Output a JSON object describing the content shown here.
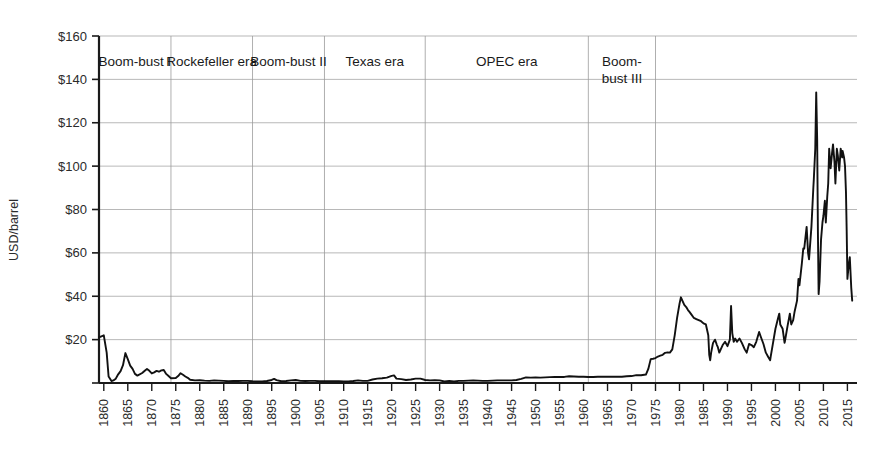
{
  "chart_data": {
    "type": "line",
    "title": "",
    "xlabel": "",
    "ylabel": "USD/barrel",
    "xlim": [
      1859,
      2017
    ],
    "ylim": [
      0,
      160
    ],
    "grid": true,
    "legend": "none",
    "y_ticks": [
      {
        "value": 160,
        "label": "$160"
      },
      {
        "value": 140,
        "label": "$140"
      },
      {
        "value": 120,
        "label": "$120"
      },
      {
        "value": 100,
        "label": "$100"
      },
      {
        "value": 80,
        "label": "$80"
      },
      {
        "value": 60,
        "label": "$60"
      },
      {
        "value": 40,
        "label": "$40"
      },
      {
        "value": 20,
        "label": "$20"
      }
    ],
    "x_ticks": [
      {
        "value": 1860,
        "label": "1860"
      },
      {
        "value": 1865,
        "label": "1865"
      },
      {
        "value": 1870,
        "label": "1870"
      },
      {
        "value": 1875,
        "label": "1875"
      },
      {
        "value": 1880,
        "label": "1880"
      },
      {
        "value": 1885,
        "label": "1885"
      },
      {
        "value": 1890,
        "label": "1890"
      },
      {
        "value": 1895,
        "label": "1895"
      },
      {
        "value": 1900,
        "label": "1900"
      },
      {
        "value": 1905,
        "label": "1905"
      },
      {
        "value": 1910,
        "label": "1910"
      },
      {
        "value": 1915,
        "label": "1915"
      },
      {
        "value": 1920,
        "label": "1920"
      },
      {
        "value": 1925,
        "label": "1925"
      },
      {
        "value": 1930,
        "label": "1930"
      },
      {
        "value": 1935,
        "label": "1935"
      },
      {
        "value": 1940,
        "label": "1940"
      },
      {
        "value": 1945,
        "label": "1945"
      },
      {
        "value": 1950,
        "label": "1950"
      },
      {
        "value": 1955,
        "label": "1955"
      },
      {
        "value": 1960,
        "label": "1960"
      },
      {
        "value": 1965,
        "label": "1965"
      },
      {
        "value": 1970,
        "label": "1970"
      },
      {
        "value": 1975,
        "label": "1975"
      },
      {
        "value": 1980,
        "label": "1980"
      },
      {
        "value": 1985,
        "label": "1985"
      },
      {
        "value": 1990,
        "label": "1990"
      },
      {
        "value": 1995,
        "label": "1995"
      },
      {
        "value": 2000,
        "label": "2000"
      },
      {
        "value": 2005,
        "label": "2005"
      },
      {
        "value": 2010,
        "label": "2010"
      },
      {
        "value": 2015,
        "label": "2015"
      }
    ],
    "eras": [
      {
        "label": "Boom-bust I",
        "start": 1859,
        "end": 1874
      },
      {
        "label": "Rockefeller era",
        "start": 1874,
        "end": 1891
      },
      {
        "label": "Boom-bust II",
        "start": 1891,
        "end": 1906
      },
      {
        "label": "Texas era",
        "start": 1906,
        "end": 1927
      },
      {
        "label": "OPEC era",
        "start": 1927,
        "end": 1961
      },
      {
        "label": "Boom-\nbust III",
        "start": 1961,
        "end": 1975
      }
    ],
    "era_boundaries_year": [
      1874,
      1891,
      1906,
      1927,
      1961,
      1975
    ],
    "series": [
      {
        "name": "Crude oil price (USD/barrel, nominal)",
        "color": "#111111",
        "points": [
          [
            1859,
            21.0
          ],
          [
            1860,
            22.0
          ],
          [
            1860.6,
            14.0
          ],
          [
            1861,
            3.0
          ],
          [
            1861.6,
            0.9
          ],
          [
            1862,
            1.2
          ],
          [
            1862.5,
            2.0
          ],
          [
            1863,
            4.0
          ],
          [
            1863.5,
            5.5
          ],
          [
            1864,
            8.2
          ],
          [
            1864.5,
            13.8
          ],
          [
            1865,
            11.0
          ],
          [
            1865.5,
            8.0
          ],
          [
            1866,
            6.5
          ],
          [
            1866.5,
            4.2
          ],
          [
            1867,
            3.4
          ],
          [
            1868,
            4.6
          ],
          [
            1868.6,
            5.8
          ],
          [
            1869,
            6.5
          ],
          [
            1869.5,
            5.6
          ],
          [
            1870,
            4.4
          ],
          [
            1870.5,
            4.9
          ],
          [
            1871,
            5.6
          ],
          [
            1871.5,
            5.2
          ],
          [
            1872,
            5.8
          ],
          [
            1872.5,
            6.0
          ],
          [
            1873,
            4.2
          ],
          [
            1873.5,
            3.2
          ],
          [
            1874,
            2.2
          ],
          [
            1875,
            2.3
          ],
          [
            1875.5,
            3.2
          ],
          [
            1876,
            4.5
          ],
          [
            1876.5,
            3.8
          ],
          [
            1877,
            3.0
          ],
          [
            1877.5,
            2.4
          ],
          [
            1878,
            1.5
          ],
          [
            1879,
            1.2
          ],
          [
            1880,
            1.3
          ],
          [
            1881,
            1.1
          ],
          [
            1882,
            1.0
          ],
          [
            1883,
            1.2
          ],
          [
            1884,
            1.1
          ],
          [
            1885,
            1.0
          ],
          [
            1886,
            0.8
          ],
          [
            1887,
            0.9
          ],
          [
            1888,
            0.9
          ],
          [
            1889,
            1.0
          ],
          [
            1890,
            1.0
          ],
          [
            1891,
            0.8
          ],
          [
            1892,
            0.7
          ],
          [
            1893,
            0.7
          ],
          [
            1894,
            0.9
          ],
          [
            1895,
            1.4
          ],
          [
            1895.5,
            1.9
          ],
          [
            1896,
            1.3
          ],
          [
            1897,
            0.8
          ],
          [
            1898,
            0.9
          ],
          [
            1899,
            1.2
          ],
          [
            1900,
            1.4
          ],
          [
            1901,
            1.0
          ],
          [
            1902,
            0.9
          ],
          [
            1903,
            1.0
          ],
          [
            1904,
            1.0
          ],
          [
            1905,
            0.8
          ],
          [
            1906,
            0.8
          ],
          [
            1907,
            0.8
          ],
          [
            1908,
            0.8
          ],
          [
            1909,
            0.8
          ],
          [
            1910,
            0.7
          ],
          [
            1911,
            0.7
          ],
          [
            1912,
            0.9
          ],
          [
            1913,
            1.2
          ],
          [
            1914,
            1.0
          ],
          [
            1915,
            1.0
          ],
          [
            1916,
            1.6
          ],
          [
            1917,
            2.0
          ],
          [
            1918,
            2.2
          ],
          [
            1919,
            2.5
          ],
          [
            1920,
            3.3
          ],
          [
            1920.5,
            3.5
          ],
          [
            1921,
            2.0
          ],
          [
            1922,
            1.8
          ],
          [
            1923,
            1.4
          ],
          [
            1924,
            1.6
          ],
          [
            1925,
            2.0
          ],
          [
            1926,
            2.0
          ],
          [
            1927,
            1.4
          ],
          [
            1928,
            1.2
          ],
          [
            1929,
            1.3
          ],
          [
            1930,
            1.2
          ],
          [
            1931,
            0.7
          ],
          [
            1932,
            0.9
          ],
          [
            1933,
            0.7
          ],
          [
            1934,
            1.0
          ],
          [
            1935,
            1.0
          ],
          [
            1936,
            1.1
          ],
          [
            1937,
            1.2
          ],
          [
            1938,
            1.1
          ],
          [
            1939,
            1.0
          ],
          [
            1940,
            1.0
          ],
          [
            1941,
            1.1
          ],
          [
            1942,
            1.2
          ],
          [
            1943,
            1.2
          ],
          [
            1944,
            1.2
          ],
          [
            1945,
            1.2
          ],
          [
            1946,
            1.4
          ],
          [
            1947,
            1.9
          ],
          [
            1948,
            2.6
          ],
          [
            1949,
            2.5
          ],
          [
            1950,
            2.6
          ],
          [
            1951,
            2.5
          ],
          [
            1952,
            2.6
          ],
          [
            1953,
            2.7
          ],
          [
            1954,
            2.8
          ],
          [
            1955,
            2.8
          ],
          [
            1956,
            2.8
          ],
          [
            1957,
            3.1
          ],
          [
            1958,
            3.0
          ],
          [
            1959,
            2.9
          ],
          [
            1960,
            2.9
          ],
          [
            1961,
            2.8
          ],
          [
            1962,
            2.8
          ],
          [
            1963,
            2.9
          ],
          [
            1964,
            2.9
          ],
          [
            1965,
            2.9
          ],
          [
            1966,
            2.9
          ],
          [
            1967,
            2.9
          ],
          [
            1968,
            2.9
          ],
          [
            1969,
            3.1
          ],
          [
            1970,
            3.2
          ],
          [
            1971,
            3.6
          ],
          [
            1972,
            3.6
          ],
          [
            1973,
            3.9
          ],
          [
            1973.5,
            6.5
          ],
          [
            1974,
            11.0
          ],
          [
            1974.5,
            11.2
          ],
          [
            1975,
            11.5
          ],
          [
            1975.5,
            12.2
          ],
          [
            1976,
            12.6
          ],
          [
            1976.5,
            13.0
          ],
          [
            1977,
            13.9
          ],
          [
            1977.5,
            14.1
          ],
          [
            1978,
            14.0
          ],
          [
            1978.5,
            15.5
          ],
          [
            1979,
            22.0
          ],
          [
            1979.5,
            30.0
          ],
          [
            1980,
            36.5
          ],
          [
            1980.3,
            39.5
          ],
          [
            1980.6,
            38.0
          ],
          [
            1981,
            36.0
          ],
          [
            1981.4,
            35.0
          ],
          [
            1981.8,
            33.5
          ],
          [
            1982,
            33.0
          ],
          [
            1982.5,
            31.5
          ],
          [
            1983,
            30.0
          ],
          [
            1983.5,
            29.5
          ],
          [
            1984,
            29.0
          ],
          [
            1984.5,
            28.5
          ],
          [
            1985,
            27.5
          ],
          [
            1985.5,
            27.0
          ],
          [
            1986,
            22.0
          ],
          [
            1986.2,
            13.0
          ],
          [
            1986.4,
            10.5
          ],
          [
            1986.6,
            14.0
          ],
          [
            1986.9,
            17.5
          ],
          [
            1987,
            18.5
          ],
          [
            1987.4,
            20.0
          ],
          [
            1987.8,
            17.5
          ],
          [
            1988,
            16.5
          ],
          [
            1988.3,
            14.0
          ],
          [
            1988.6,
            15.5
          ],
          [
            1989,
            17.5
          ],
          [
            1989.5,
            19.0
          ],
          [
            1990,
            17.0
          ],
          [
            1990.5,
            20.0
          ],
          [
            1990.75,
            35.5
          ],
          [
            1991,
            23.0
          ],
          [
            1991.3,
            19.0
          ],
          [
            1991.6,
            20.5
          ],
          [
            1992,
            19.0
          ],
          [
            1992.5,
            20.5
          ],
          [
            1993,
            18.5
          ],
          [
            1993.6,
            15.5
          ],
          [
            1994,
            14.0
          ],
          [
            1994.5,
            18.0
          ],
          [
            1995,
            17.5
          ],
          [
            1995.5,
            16.5
          ],
          [
            1996,
            19.0
          ],
          [
            1996.6,
            23.5
          ],
          [
            1997,
            21.0
          ],
          [
            1997.5,
            18.0
          ],
          [
            1998,
            14.0
          ],
          [
            1998.5,
            12.0
          ],
          [
            1998.9,
            10.5
          ],
          [
            1999,
            12.0
          ],
          [
            1999.5,
            18.5
          ],
          [
            2000,
            25.0
          ],
          [
            2000.5,
            29.5
          ],
          [
            2000.8,
            32.0
          ],
          [
            2001,
            27.0
          ],
          [
            2001.5,
            25.0
          ],
          [
            2001.9,
            18.5
          ],
          [
            2002,
            19.5
          ],
          [
            2002.5,
            26.0
          ],
          [
            2003,
            32.0
          ],
          [
            2003.3,
            27.0
          ],
          [
            2003.7,
            29.0
          ],
          [
            2004,
            33.0
          ],
          [
            2004.5,
            38.0
          ],
          [
            2004.8,
            48.0
          ],
          [
            2005,
            45.0
          ],
          [
            2005.5,
            55.0
          ],
          [
            2005.8,
            62.0
          ],
          [
            2006,
            62.0
          ],
          [
            2006.5,
            72.0
          ],
          [
            2006.8,
            60.0
          ],
          [
            2007,
            57.0
          ],
          [
            2007.5,
            72.0
          ],
          [
            2007.9,
            90.0
          ],
          [
            2008,
            94.0
          ],
          [
            2008.3,
            108.0
          ],
          [
            2008.5,
            134.0
          ],
          [
            2008.7,
            112.0
          ],
          [
            2008.85,
            70.0
          ],
          [
            2009,
            41.0
          ],
          [
            2009.2,
            47.0
          ],
          [
            2009.5,
            66.0
          ],
          [
            2009.8,
            74.0
          ],
          [
            2010,
            77.0
          ],
          [
            2010.3,
            84.0
          ],
          [
            2010.5,
            74.0
          ],
          [
            2010.8,
            86.0
          ],
          [
            2011,
            92.0
          ],
          [
            2011.2,
            108.0
          ],
          [
            2011.5,
            99.0
          ],
          [
            2011.8,
            106.0
          ],
          [
            2012,
            110.0
          ],
          [
            2012.3,
            102.0
          ],
          [
            2012.5,
            92.0
          ],
          [
            2012.8,
            108.0
          ],
          [
            2013,
            105.0
          ],
          [
            2013.3,
            98.0
          ],
          [
            2013.6,
            108.0
          ],
          [
            2013.9,
            104.0
          ],
          [
            2014,
            107.0
          ],
          [
            2014.3,
            104.0
          ],
          [
            2014.5,
            100.0
          ],
          [
            2014.7,
            88.0
          ],
          [
            2014.85,
            70.0
          ],
          [
            2015,
            48.0
          ],
          [
            2015.3,
            55.0
          ],
          [
            2015.5,
            58.0
          ],
          [
            2015.8,
            44.0
          ],
          [
            2016,
            38.0
          ]
        ]
      }
    ],
    "annotations": {
      "peak_2008": {
        "year": 2008.5,
        "value": 134
      },
      "peak_1980": {
        "year": 1980.3,
        "value": 39.5
      },
      "peak_1860": {
        "year": 1860,
        "value": 22
      },
      "final_value": {
        "year": 2016,
        "value": 38
      }
    }
  },
  "axis": {
    "y_axis_title": "USD/barrel"
  }
}
